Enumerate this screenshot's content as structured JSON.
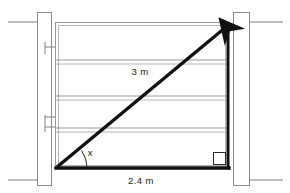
{
  "diagram": {
    "labels": {
      "hypotenuse": "3 m",
      "base": "2.4 m",
      "angle": "x"
    },
    "colors": {
      "triangle_stroke": "#111111",
      "gate_frame": "#9a9a9a",
      "post_outline": "#8c8c8c",
      "ground_line": "#7a7a7a",
      "background": "#ffffff",
      "label_text": "#1a1a1a"
    },
    "geometry": {
      "triangle": {
        "apex_top_right": [
          228,
          23
        ],
        "vertex_bottom_left": [
          57,
          168
        ],
        "vertex_bottom_right": [
          228,
          168
        ],
        "has_arrowhead_at_apex": true,
        "right_angle_marker_corner": "bottom-right"
      },
      "gate": {
        "left": 55,
        "right": 229,
        "top": 22,
        "bottom": 169,
        "rail_count": 4
      },
      "posts": [
        {
          "name": "left-post",
          "x": 37,
          "width": 15,
          "top": 12,
          "bottom": 186
        },
        {
          "name": "right-post",
          "x": 233,
          "width": 17,
          "top": 12,
          "bottom": 186
        }
      ],
      "hinges": [
        {
          "name": "upper-hinge",
          "y": 47
        },
        {
          "name": "lower-hinge",
          "y": 122
        }
      ],
      "fence_wire_y": [
        22,
        180
      ]
    },
    "label_positions": {
      "hypotenuse": [
        140,
        75
      ],
      "base": [
        141,
        180
      ],
      "angle": [
        88,
        153
      ]
    }
  }
}
